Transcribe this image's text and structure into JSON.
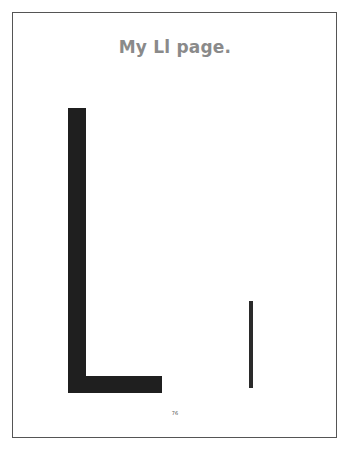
{
  "page": {
    "title": "My Ll page.",
    "letters": {
      "uppercase": "L",
      "lowercase": "l"
    },
    "page_number": "76"
  },
  "colors": {
    "title": "#8a8a8a",
    "letter_fill": "#1f1f1f",
    "frame_border": "#555555",
    "background": "#ffffff"
  }
}
